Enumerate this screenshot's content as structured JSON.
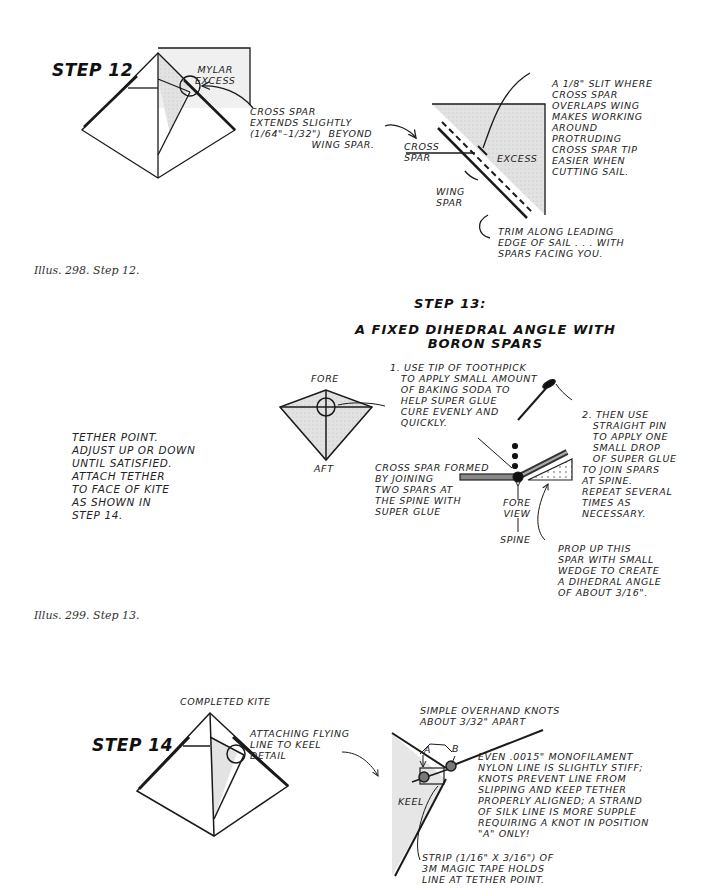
{
  "step12": {
    "title": "STEP 12",
    "mylar_label": "MYLAR\nEXCESS",
    "cross_spar_note": "CROSS SPAR\nEXTENDS SLIGHTLY\n(1/64\"–1/32\")  BEYOND\n                 WING SPAR.",
    "slit_note": "A 1/8\" SLIT WHERE\nCROSS SPAR\nOVERLAPS WING\nMAKES WORKING\nAROUND\nPROTRUDING\nCROSS SPAR TIP\nEASIER WHEN\nCUTTING SAIL.",
    "cross_spar_label": "CROSS\nSPAR",
    "excess_label": "EXCESS",
    "wing_spar_label": "WING\nSPAR",
    "trim_note": "TRIM ALONG LEADING\nEDGE OF SAIL . . . WITH\nSPARS FACING YOU.",
    "caption": "Illus. 298. Step 12."
  },
  "step13": {
    "title": "STEP 13:",
    "subtitle": "A FIXED DIHEDRAL ANGLE WITH\nBORON SPARS",
    "fore_label": "FORE",
    "aft_label": "AFT",
    "tether_note": "TETHER POINT.\nADJUST UP OR DOWN\nUNTIL SATISFIED.\nATTACH TETHER\nTO FACE OF KITE\nAS SHOWN IN\nSTEP 14.",
    "note1": "1. USE TIP OF TOOTHPICK\n   TO APPLY SMALL AMOUNT\n   OF BAKING SODA TO\n   HELP SUPER GLUE\n   CURE EVENLY AND\n   QUICKLY.",
    "note2": "2. THEN USE\n   STRAIGHT PIN\n   TO APPLY ONE\n   SMALL DROP\n   OF SUPER GLUE\nTO JOIN SPARS\nAT SPINE.\nREPEAT SEVERAL\nTIMES AS\nNECESSARY.",
    "cross_spar_formed": "CROSS SPAR FORMED\nBY JOINING\nTWO SPARS AT\nTHE SPINE WITH\nSUPER GLUE",
    "fore_view": "FORE\nVIEW",
    "spine_label": "SPINE",
    "prop_note": "PROP UP THIS\nSPAR WITH SMALL\nWEDGE TO CREATE\nA DIHEDRAL ANGLE\nOF ABOUT 3/16\".",
    "caption": "Illus. 299. Step 13."
  },
  "step14": {
    "title": "STEP 14",
    "completed_kite": "COMPLETED KITE",
    "attaching_note": "ATTACHING FLYING\nLINE TO KEEL\nDETAIL",
    "knots_note": "SIMPLE OVERHAND KNOTS\nABOUT 3/32\" APART",
    "knot_a": "A",
    "knot_b": "B",
    "keel_label": "KEEL",
    "monofilament_note": "EVEN .0015\" MONOFILAMENT\nNYLON LINE IS SLIGHTLY STIFF;\nKNOTS PREVENT LINE FROM\nSLIPPING AND KEEP TETHER\nPROPERLY ALIGNED; A STRAND\nOF SILK LINE IS MORE SUPPLE\nREQUIRING A KNOT IN POSITION\n\"A\" ONLY!",
    "strip_note": "STRIP (1/16\" X 3/16\") OF\n3M MAGIC TAPE HOLDS\nLINE AT TETHER POINT."
  },
  "colors": {
    "ink": "#1a1a1a",
    "shade": "#dcdcdc",
    "paper": "#ffffff"
  }
}
